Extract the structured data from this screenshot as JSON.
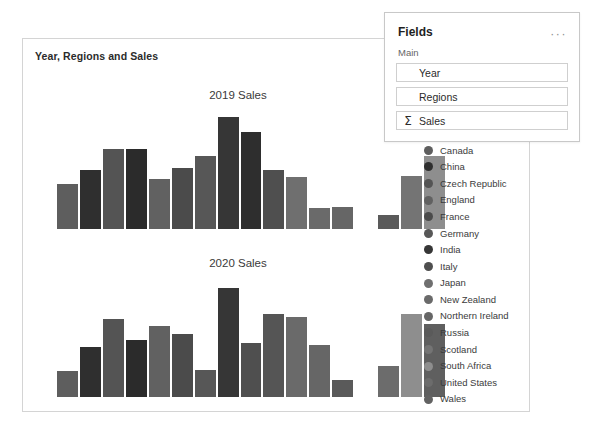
{
  "visual": {
    "title": "Year, Regions and Sales"
  },
  "fields_panel": {
    "title": "Fields",
    "ellipsis": "···",
    "section_label": "Main",
    "sigma_glyph": "Σ",
    "items": [
      {
        "label": "Year",
        "aggregated": false
      },
      {
        "label": "Regions",
        "aggregated": false
      },
      {
        "label": "Sales",
        "aggregated": true
      }
    ]
  },
  "legend": {
    "items": [
      {
        "label": "Canada",
        "color": "#5e5e5e"
      },
      {
        "label": "China",
        "color": "#2f2f2f"
      },
      {
        "label": "Czech Republic",
        "color": "#545454"
      },
      {
        "label": "England",
        "color": "#616161"
      },
      {
        "label": "France",
        "color": "#4b4b4b"
      },
      {
        "label": "Germany",
        "color": "#575757"
      },
      {
        "label": "India",
        "color": "#363636"
      },
      {
        "label": "Italy",
        "color": "#4f4f4f"
      },
      {
        "label": "Japan",
        "color": "#6f6f6f"
      },
      {
        "label": "New Zealand",
        "color": "#6a6a6a"
      },
      {
        "label": "Northern Ireland",
        "color": "#666666"
      },
      {
        "label": "Russia",
        "color": "#5a5a5a"
      },
      {
        "label": "Scotland",
        "color": "#747474"
      },
      {
        "label": "South Africa",
        "color": "#8e8e8e"
      },
      {
        "label": "United States",
        "color": "#6c6c6c"
      },
      {
        "label": "Wales",
        "color": "#626262"
      }
    ]
  },
  "chart_data": [
    {
      "type": "bar",
      "title": "2019 Sales",
      "xlabel": "",
      "ylabel": "",
      "ylim": [
        0,
        100
      ],
      "grid": false,
      "legend_position": "right",
      "categories": [
        "Canada",
        "China",
        "Czech Republic",
        "England",
        "France",
        "Germany",
        "India",
        "Italy",
        "Japan",
        "New Zealand",
        "Northern Ireland",
        "Russia",
        "Scotland",
        "South Africa",
        "United States",
        "Wales"
      ],
      "values": [
        38,
        50,
        68,
        68,
        42,
        52,
        62,
        95,
        82,
        50,
        44,
        18,
        19,
        12,
        45,
        62
      ],
      "colors": [
        "#5e5e5e",
        "#2f2f2f",
        "#545454",
        "#2b2b2b",
        "#616161",
        "#4b4b4b",
        "#575757",
        "#363636",
        "#2e2e2e",
        "#4f4f4f",
        "#6f6f6f",
        "#6a6a6a",
        "#666666",
        "#5a5a5a",
        "#747474",
        "#8e8e8e"
      ],
      "gaps_after": [
        13
      ]
    },
    {
      "type": "bar",
      "title": "2020 Sales",
      "xlabel": "",
      "ylabel": "",
      "ylim": [
        0,
        100
      ],
      "grid": false,
      "legend_position": "right",
      "categories": [
        "Canada",
        "China",
        "Czech Republic",
        "England",
        "France",
        "Germany",
        "India",
        "Italy",
        "Japan",
        "New Zealand",
        "Northern Ireland",
        "Russia",
        "Scotland",
        "South Africa",
        "United States",
        "Wales"
      ],
      "values": [
        22,
        42,
        66,
        48,
        60,
        53,
        23,
        92,
        46,
        70,
        68,
        44,
        14,
        26,
        70,
        62
      ],
      "colors": [
        "#5e5e5e",
        "#2f2f2f",
        "#545454",
        "#2b2b2b",
        "#616161",
        "#4b4b4b",
        "#575757",
        "#363636",
        "#4f4f4f",
        "#555555",
        "#6a6a6a",
        "#666666",
        "#5a5a5a",
        "#6c6c6c",
        "#8e8e8e",
        "#5f5f5f"
      ],
      "gaps_after": [
        13
      ]
    }
  ]
}
